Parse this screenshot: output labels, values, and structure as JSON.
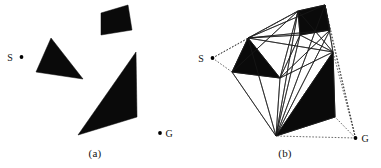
{
  "figure": {
    "type": "visibility-graph-diagram",
    "background_color": "#ffffff",
    "ink_color": "#0a0a0a",
    "panels": [
      {
        "id": "a",
        "caption": "(a)",
        "start_label": "S",
        "goal_label": "G",
        "start_point": [
          21.5,
          57.0
        ],
        "goal_point": [
          160.0,
          133.0
        ],
        "obstacles": [
          {
            "name": "quad-obstacle-top",
            "points": "101,13 128,5 132,30 101,35"
          },
          {
            "name": "triangle-obstacle-left",
            "points": "51,38 36,72 83,79"
          },
          {
            "name": "triangle-obstacle-large",
            "points": "136,52 137,117 78,135"
          }
        ]
      },
      {
        "id": "b",
        "caption": "(b)",
        "start_label": "S",
        "goal_label": "G",
        "start_point": [
          22.5,
          58.0
        ],
        "goal_point": [
          165.5,
          138.0
        ],
        "obstacles": [
          {
            "name": "quad-obstacle-top",
            "points": "108,11 135,5 140,30 110,35"
          },
          {
            "name": "triangle-obstacle-left",
            "points": "58,38 42,72 90,78"
          },
          {
            "name": "triangle-obstacle-large",
            "points": "143,52 145,117 86,136"
          }
        ],
        "vertices": {
          "S": [
            22.5,
            58.0
          ],
          "G": [
            165.5,
            138.0
          ],
          "q1": [
            108,
            11
          ],
          "q2": [
            135,
            5
          ],
          "q3": [
            140,
            30
          ],
          "q4": [
            110,
            35
          ],
          "t1": [
            58,
            38
          ],
          "t2": [
            42,
            72
          ],
          "t3": [
            90,
            78
          ],
          "r1": [
            143,
            52
          ],
          "r2": [
            145,
            117
          ],
          "r3": [
            86,
            136
          ]
        },
        "solid_edges": [
          [
            "t1",
            "q1"
          ],
          [
            "t1",
            "q2"
          ],
          [
            "t1",
            "q4"
          ],
          [
            "t1",
            "r1"
          ],
          [
            "t1",
            "t3"
          ],
          [
            "t1",
            "t2"
          ],
          [
            "t3",
            "q1"
          ],
          [
            "t3",
            "q4"
          ],
          [
            "t3",
            "r1"
          ],
          [
            "t3",
            "q3"
          ],
          [
            "t3",
            "r3"
          ],
          [
            "t3",
            "t2"
          ],
          [
            "q1",
            "q2"
          ],
          [
            "q2",
            "q3"
          ],
          [
            "q3",
            "q4"
          ],
          [
            "q4",
            "q1"
          ],
          [
            "q4",
            "r1"
          ],
          [
            "q1",
            "r1"
          ],
          [
            "q2",
            "r1"
          ],
          [
            "r1",
            "r2"
          ],
          [
            "r2",
            "r3"
          ],
          [
            "r3",
            "r1"
          ],
          [
            "r3",
            "q4"
          ],
          [
            "r3",
            "q1"
          ],
          [
            "r3",
            "t1"
          ],
          [
            "t2",
            "r3"
          ],
          [
            "q2",
            "r3"
          ],
          [
            "q3",
            "r3"
          ],
          [
            "t1",
            "q3"
          ],
          [
            "t2",
            "q1"
          ]
        ],
        "dashed_edges": [
          [
            "S",
            "t1"
          ],
          [
            "S",
            "t2"
          ],
          [
            "S",
            "q1"
          ],
          [
            "G",
            "r2"
          ],
          [
            "G",
            "r3"
          ],
          [
            "G",
            "q3"
          ],
          [
            "G",
            "r1"
          ],
          [
            "G",
            "q2"
          ]
        ]
      }
    ]
  }
}
